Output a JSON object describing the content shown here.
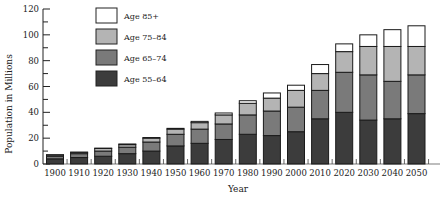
{
  "chart_data": {
    "type": "bar",
    "stacked": true,
    "title": "",
    "xlabel": "Year",
    "ylabel": "Population in Millions",
    "ylim": [
      0,
      120
    ],
    "yticks": [
      0,
      20,
      40,
      60,
      80,
      100,
      120
    ],
    "grid": false,
    "legend_position": "upper-left",
    "categories": [
      "1900",
      "1910",
      "1920",
      "1930",
      "1940",
      "1950",
      "1960",
      "1970",
      "1980",
      "1990",
      "2000",
      "2010",
      "2020",
      "2030",
      "2040",
      "2050"
    ],
    "series": [
      {
        "name": "Age 55–64",
        "color": "#3c3c3c",
        "values": [
          4,
          5,
          6,
          8,
          10,
          14,
          16,
          19,
          23,
          22,
          25,
          35,
          40,
          34,
          35,
          39
        ]
      },
      {
        "name": "Age 65–74",
        "color": "#7a7a7a",
        "values": [
          2,
          3,
          4,
          5,
          7,
          9,
          11,
          12,
          15,
          19,
          19,
          22,
          31,
          35,
          29,
          30
        ]
      },
      {
        "name": "Age 75–84",
        "color": "#b4b4b4",
        "values": [
          1,
          1,
          2,
          2,
          3,
          4,
          5,
          7,
          9,
          10,
          13,
          13,
          16,
          22,
          27,
          22
        ]
      },
      {
        "name": "Age 85+",
        "color": "#ffffff",
        "values": [
          0.2,
          0.2,
          0.3,
          0.5,
          0.5,
          0.6,
          1,
          1.5,
          2,
          4,
          4,
          7,
          6,
          9,
          13,
          16
        ]
      }
    ]
  },
  "legend": {
    "items": [
      "Age 85+",
      "Age 75–84",
      "Age 65–74",
      "Age 55–64"
    ]
  }
}
